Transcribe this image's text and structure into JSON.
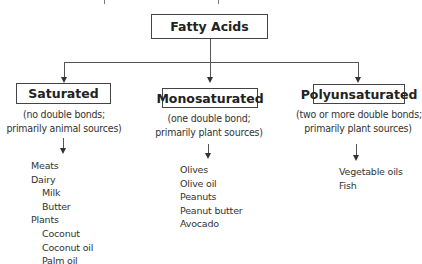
{
  "diagram": {
    "root": {
      "label": "Fatty Acids"
    },
    "categories": [
      {
        "label": "Saturated",
        "subtitle": [
          "(no double bonds;",
          "primarily animal sources)"
        ],
        "items": [
          {
            "label": "Meats",
            "level": 0
          },
          {
            "label": "Dairy",
            "level": 0
          },
          {
            "label": "Milk",
            "level": 1
          },
          {
            "label": "Butter",
            "level": 1
          },
          {
            "label": "Plants",
            "level": 0
          },
          {
            "label": "Coconut",
            "level": 1
          },
          {
            "label": "Coconut oil",
            "level": 1
          },
          {
            "label": "Palm oil",
            "level": 1
          }
        ]
      },
      {
        "label": "Monosaturated",
        "subtitle": [
          "(one double bond;",
          "primarily plant sources)"
        ],
        "items": [
          {
            "label": "Olives",
            "level": 0
          },
          {
            "label": "Olive oil",
            "level": 0
          },
          {
            "label": "Peanuts",
            "level": 0
          },
          {
            "label": "Peanut butter",
            "level": 0
          },
          {
            "label": "Avocado",
            "level": 0
          }
        ]
      },
      {
        "label": "Polyunsaturated",
        "subtitle": [
          "(two or more double bonds;",
          "primarily plant sources)"
        ],
        "items": [
          {
            "label": "Vegetable oils",
            "level": 0
          },
          {
            "label": "Fish",
            "level": 0
          }
        ]
      }
    ],
    "colors": {
      "line": "#555555",
      "text": "#2a2a2a",
      "box_border": "#444444",
      "background": "#ffffff"
    }
  }
}
